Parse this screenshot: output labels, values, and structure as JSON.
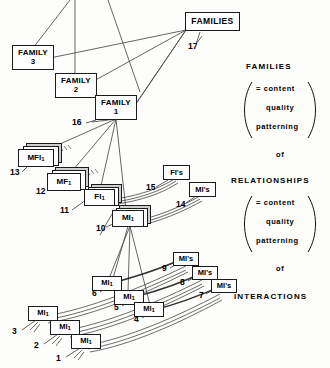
{
  "figure": {
    "background": "#fdfdfc",
    "ink": "#1b1b1b"
  },
  "boxes": {
    "families_top": {
      "label": "FAMILIES"
    },
    "family3": {
      "line1": "FAMILY",
      "line2": "3"
    },
    "family2": {
      "line1": "FAMILY",
      "line2": "2"
    },
    "family1": {
      "line1": "FAMILY",
      "line2": "1"
    },
    "mfi1": {
      "line1": "MFI",
      "sub": "1"
    },
    "mf1": {
      "line1": "MF",
      "sub": "1"
    },
    "fi1": {
      "line1": "FI",
      "sub": "1"
    },
    "mi1_10": {
      "line1": "MI",
      "sub": "1"
    },
    "fis": {
      "label": "FI's"
    },
    "mis_14": {
      "label": "MI's"
    },
    "mis_9": {
      "label": "MI's"
    },
    "mis_8": {
      "label": "MI's"
    },
    "mis_7": {
      "label": "MI's"
    },
    "mi1_6": {
      "line1": "MI",
      "sub": "1"
    },
    "mi1_5": {
      "line1": "MI",
      "sub": "1"
    },
    "mi1_4": {
      "line1": "MI",
      "sub": "1"
    },
    "mi1_3": {
      "line1": "MI",
      "sub": "1"
    },
    "mi1_2": {
      "line1": "MI",
      "sub": "1"
    },
    "mi1_1": {
      "line1": "MI",
      "sub": "1"
    }
  },
  "callouts": {
    "n1": "1",
    "n2": "2",
    "n3": "3",
    "n4": "4",
    "n5": "5",
    "n6": "6",
    "n7": "7",
    "n8": "8",
    "n9": "9",
    "n10": "10",
    "n11": "11",
    "n12": "12",
    "n13": "13",
    "n14": "14",
    "n15": "15",
    "n16": "16",
    "n17": "17"
  },
  "legend": {
    "families_heading": "FAMILIES",
    "relationships_heading": "RELATIONSHIPS",
    "interactions_heading": "INTERACTIONS",
    "group_a": {
      "row1": "= content",
      "row2": "quality",
      "row3": "patterning",
      "row4": "of"
    },
    "group_b": {
      "row1": "= content",
      "row2": "quality",
      "row3": "patterning",
      "row4": "of"
    }
  }
}
